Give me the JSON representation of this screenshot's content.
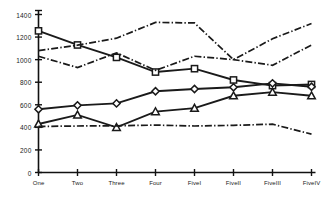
{
  "chart_data": {
    "type": "line",
    "title": "",
    "xlabel": "",
    "ylabel": "",
    "ylim": [
      0,
      1400
    ],
    "yticks": [
      0,
      200,
      400,
      600,
      800,
      1000,
      1200,
      1400
    ],
    "ytick_labels": [
      "0",
      "200",
      "400",
      "600",
      "800",
      "1000",
      "1200",
      "1400"
    ],
    "categories": [
      "One",
      "Two",
      "Three",
      "Four",
      "FiveI",
      "FiveII",
      "FiveIII",
      "FiveIV"
    ],
    "grid": false,
    "legend": "none",
    "series": [
      {
        "name": "Series 1",
        "marker": "square",
        "line_style": "solid",
        "color": "#1a1a1a",
        "values": [
          1255,
          1130,
          1020,
          890,
          920,
          820,
          770,
          780
        ]
      },
      {
        "name": "Series 2",
        "marker": "diamond",
        "line_style": "solid",
        "color": "#1a1a1a",
        "values": [
          560,
          595,
          612,
          720,
          740,
          755,
          790,
          760
        ]
      },
      {
        "name": "Series 3",
        "marker": "triangle",
        "line_style": "solid",
        "color": "#1a1a1a",
        "values": [
          430,
          510,
          400,
          540,
          570,
          680,
          712,
          680
        ]
      },
      {
        "name": "Series 4",
        "marker": "none",
        "line_style": "dashdot",
        "color": "#1a1a1a",
        "values": [
          1080,
          1128,
          1190,
          1330,
          1325,
          1000,
          1185,
          1320
        ]
      },
      {
        "name": "Series 5",
        "marker": "none",
        "line_style": "dashdot",
        "color": "#1a1a1a",
        "values": [
          1030,
          930,
          1060,
          905,
          1030,
          1000,
          950,
          1130
        ]
      },
      {
        "name": "Series 6",
        "marker": "none",
        "line_style": "dashdot",
        "color": "#1a1a1a",
        "values": [
          408,
          412,
          414,
          420,
          412,
          418,
          428,
          340
        ]
      }
    ]
  },
  "axis": {
    "axis_color": "#111111",
    "tick_color": "#111111"
  }
}
